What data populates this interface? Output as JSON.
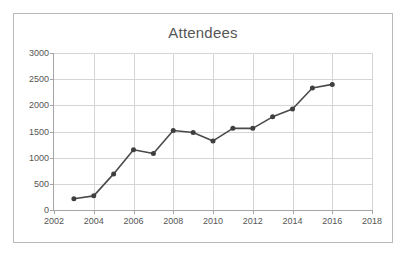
{
  "chart_data": {
    "type": "line",
    "title": "Attendees",
    "xlabel": "",
    "ylabel": "",
    "xlim": [
      2002,
      2018
    ],
    "ylim": [
      0,
      3000
    ],
    "x_tick_labels": [
      "2002",
      "2004",
      "2006",
      "2008",
      "2010",
      "2012",
      "2014",
      "2016",
      "2018"
    ],
    "x_tick_values": [
      2002,
      2004,
      2006,
      2008,
      2010,
      2012,
      2014,
      2016,
      2018
    ],
    "y_tick_labels": [
      "0",
      "500",
      "1000",
      "1500",
      "2000",
      "2500",
      "3000"
    ],
    "y_tick_values": [
      0,
      500,
      1000,
      1500,
      2000,
      2500,
      3000
    ],
    "grid": true,
    "legend": false,
    "marker": "circle",
    "line_color": "#4a4a4a",
    "marker_color": "#3f3f3f",
    "grid_color": "#d5d5d5",
    "axis_color": "#a6a6a6",
    "title_color": "#565656",
    "tick_color": "#555555",
    "background": "#ffffff",
    "border_color": "#b8b8b8",
    "x": [
      2003,
      2004,
      2005,
      2006,
      2007,
      2008,
      2009,
      2010,
      2011,
      2012,
      2013,
      2014,
      2015,
      2016
    ],
    "values": [
      215,
      270,
      690,
      1150,
      1080,
      1520,
      1480,
      1320,
      1560,
      1560,
      1780,
      1930,
      2330,
      2400
    ],
    "points": [
      {
        "x": 2003,
        "y": 215
      },
      {
        "x": 2004,
        "y": 270
      },
      {
        "x": 2005,
        "y": 690
      },
      {
        "x": 2006,
        "y": 1150
      },
      {
        "x": 2007,
        "y": 1080
      },
      {
        "x": 2008,
        "y": 1520
      },
      {
        "x": 2009,
        "y": 1480
      },
      {
        "x": 2010,
        "y": 1320
      },
      {
        "x": 2011,
        "y": 1560
      },
      {
        "x": 2012,
        "y": 1560
      },
      {
        "x": 2013,
        "y": 1780
      },
      {
        "x": 2014,
        "y": 1930
      },
      {
        "x": 2015,
        "y": 2330
      },
      {
        "x": 2016,
        "y": 2400
      }
    ]
  }
}
